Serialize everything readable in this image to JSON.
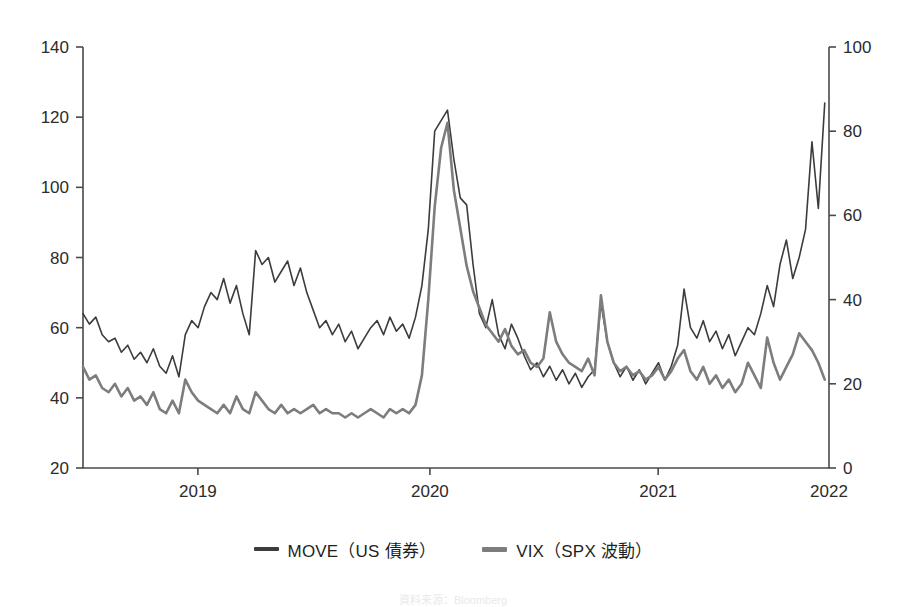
{
  "figure": {
    "title_clipped": "",
    "source_note": "資料来源：Bloomberg",
    "background": "#ffffff"
  },
  "legend": {
    "position": "bottom-center",
    "items": [
      {
        "label": "MOVE（US 債券）",
        "color": "#3c3c3c",
        "series": "MOVE",
        "width": "thin"
      },
      {
        "label": "VIX（SPX 波動）",
        "color": "#7d7d7d",
        "series": "VIX",
        "width": "thick"
      }
    ]
  },
  "axes": {
    "left": {
      "ticks": [
        "20",
        "40",
        "60",
        "80",
        "100",
        "120",
        "140"
      ],
      "min": 20,
      "max": 140,
      "step": 20,
      "series": "MOVE"
    },
    "right": {
      "ticks": [
        "0",
        "20",
        "40",
        "60",
        "80",
        "100"
      ],
      "min": 0,
      "max": 100,
      "step": 20,
      "series": "VIX"
    },
    "x": {
      "ticks": [
        "2019",
        "2020",
        "2021",
        "2022"
      ],
      "tick_positions_frac": [
        0.154,
        0.465,
        0.771,
        1.0
      ],
      "min": "2018-07",
      "max": "2022-01"
    },
    "grid": false,
    "frame": "#4a4a4a"
  },
  "chart_data": {
    "type": "line",
    "title": "",
    "xlabel": "",
    "ylabel": "",
    "y2label": "",
    "ylim": [
      20,
      140
    ],
    "y2lim": [
      0,
      100
    ],
    "xlim": [
      2018.5,
      2022.0
    ],
    "grid": false,
    "legend_position": "bottom",
    "series": [
      {
        "name": "MOVE（US 債券）",
        "axis": "left",
        "color": "#3c3c3c",
        "linewidth": 1.6,
        "x": [
          2018.5,
          2018.53,
          2018.56,
          2018.59,
          2018.62,
          2018.65,
          2018.68,
          2018.71,
          2018.74,
          2018.77,
          2018.8,
          2018.83,
          2018.86,
          2018.89,
          2018.92,
          2018.95,
          2018.98,
          2019.01,
          2019.04,
          2019.07,
          2019.1,
          2019.13,
          2019.16,
          2019.19,
          2019.22,
          2019.25,
          2019.28,
          2019.31,
          2019.34,
          2019.37,
          2019.4,
          2019.43,
          2019.46,
          2019.49,
          2019.52,
          2019.55,
          2019.58,
          2019.61,
          2019.64,
          2019.67,
          2019.7,
          2019.73,
          2019.76,
          2019.79,
          2019.82,
          2019.85,
          2019.88,
          2019.91,
          2019.94,
          2019.97,
          2020.0,
          2020.03,
          2020.06,
          2020.09,
          2020.12,
          2020.15,
          2020.18,
          2020.21,
          2020.24,
          2020.27,
          2020.3,
          2020.33,
          2020.36,
          2020.39,
          2020.42,
          2020.45,
          2020.48,
          2020.51,
          2020.54,
          2020.57,
          2020.6,
          2020.63,
          2020.66,
          2020.69,
          2020.72,
          2020.75,
          2020.78,
          2020.81,
          2020.84,
          2020.87,
          2020.9,
          2020.93,
          2020.96,
          2020.99,
          2021.02,
          2021.05,
          2021.08,
          2021.11,
          2021.14,
          2021.17,
          2021.2,
          2021.23,
          2021.26,
          2021.29,
          2021.32,
          2021.35,
          2021.38,
          2021.41,
          2021.44,
          2021.47,
          2021.5,
          2021.53,
          2021.56,
          2021.59,
          2021.62,
          2021.65,
          2021.68,
          2021.71,
          2021.74,
          2021.77,
          2021.8,
          2021.83,
          2021.86,
          2021.89,
          2021.92,
          2021.95,
          2021.98
        ],
        "values": [
          64,
          61,
          63,
          58,
          56,
          57,
          53,
          55,
          51,
          53,
          50,
          54,
          49,
          47,
          52,
          46,
          58,
          62,
          60,
          66,
          70,
          68,
          74,
          67,
          72,
          64,
          58,
          82,
          78,
          80,
          73,
          76,
          79,
          72,
          77,
          70,
          65,
          60,
          62,
          58,
          61,
          56,
          59,
          54,
          57,
          60,
          62,
          58,
          63,
          59,
          61,
          57,
          63,
          72,
          88,
          116,
          119,
          122,
          108,
          97,
          95,
          78,
          64,
          60,
          68,
          58,
          54,
          61,
          57,
          52,
          48,
          50,
          46,
          49,
          45,
          48,
          44,
          47,
          43,
          46,
          48,
          67,
          56,
          50,
          46,
          49,
          45,
          48,
          44,
          47,
          50,
          45,
          49,
          55,
          71,
          60,
          57,
          62,
          56,
          59,
          54,
          58,
          52,
          56,
          60,
          58,
          64,
          72,
          66,
          78,
          85,
          74,
          80,
          88,
          113,
          94,
          124
        ]
      },
      {
        "name": "VIX（SPX 波動）",
        "axis": "right",
        "color": "#7d7d7d",
        "linewidth": 2.6,
        "x": [
          2018.5,
          2018.53,
          2018.56,
          2018.59,
          2018.62,
          2018.65,
          2018.68,
          2018.71,
          2018.74,
          2018.77,
          2018.8,
          2018.83,
          2018.86,
          2018.89,
          2018.92,
          2018.95,
          2018.98,
          2019.01,
          2019.04,
          2019.07,
          2019.1,
          2019.13,
          2019.16,
          2019.19,
          2019.22,
          2019.25,
          2019.28,
          2019.31,
          2019.34,
          2019.37,
          2019.4,
          2019.43,
          2019.46,
          2019.49,
          2019.52,
          2019.55,
          2019.58,
          2019.61,
          2019.64,
          2019.67,
          2019.7,
          2019.73,
          2019.76,
          2019.79,
          2019.82,
          2019.85,
          2019.88,
          2019.91,
          2019.94,
          2019.97,
          2020.0,
          2020.03,
          2020.06,
          2020.09,
          2020.12,
          2020.15,
          2020.18,
          2020.21,
          2020.24,
          2020.27,
          2020.3,
          2020.33,
          2020.36,
          2020.39,
          2020.42,
          2020.45,
          2020.48,
          2020.51,
          2020.54,
          2020.57,
          2020.6,
          2020.63,
          2020.66,
          2020.69,
          2020.72,
          2020.75,
          2020.78,
          2020.81,
          2020.84,
          2020.87,
          2020.9,
          2020.93,
          2020.96,
          2020.99,
          2021.02,
          2021.05,
          2021.08,
          2021.11,
          2021.14,
          2021.17,
          2021.2,
          2021.23,
          2021.26,
          2021.29,
          2021.32,
          2021.35,
          2021.38,
          2021.41,
          2021.44,
          2021.47,
          2021.5,
          2021.53,
          2021.56,
          2021.59,
          2021.62,
          2021.65,
          2021.68,
          2021.71,
          2021.74,
          2021.77,
          2021.8,
          2021.83,
          2021.86,
          2021.89,
          2021.92,
          2021.95,
          2021.98
        ],
        "values": [
          24,
          21,
          22,
          19,
          18,
          20,
          17,
          19,
          16,
          17,
          15,
          18,
          14,
          13,
          16,
          13,
          21,
          18,
          16,
          15,
          14,
          13,
          15,
          13,
          17,
          14,
          13,
          18,
          16,
          14,
          13,
          15,
          13,
          14,
          13,
          14,
          15,
          13,
          14,
          13,
          13,
          12,
          13,
          12,
          13,
          14,
          13,
          12,
          14,
          13,
          14,
          13,
          15,
          22,
          40,
          62,
          76,
          82,
          66,
          57,
          48,
          42,
          38,
          34,
          32,
          30,
          33,
          29,
          27,
          28,
          25,
          24,
          26,
          37,
          30,
          27,
          25,
          24,
          23,
          26,
          22,
          41,
          30,
          25,
          23,
          24,
          22,
          23,
          21,
          22,
          24,
          21,
          23,
          26,
          28,
          23,
          21,
          24,
          20,
          22,
          19,
          21,
          18,
          20,
          25,
          22,
          19,
          31,
          25,
          21,
          24,
          27,
          32,
          30,
          28,
          25,
          21
        ]
      }
    ]
  }
}
